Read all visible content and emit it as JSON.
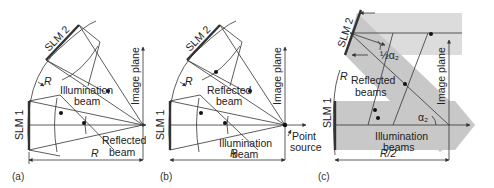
{
  "figure": {
    "panels": [
      {
        "id": "a",
        "tag": "(a)",
        "labels": {
          "slm1": "SLM 1",
          "slm2": "SLM 2",
          "image_plane": "Image plane",
          "radius_small": "R",
          "radius_bottom": "R",
          "illum_1": "Illumination",
          "illum_2": "beam",
          "refl_1": "Reflected",
          "refl_2": "beam"
        }
      },
      {
        "id": "b",
        "tag": "(b)",
        "labels": {
          "slm1": "SLM 1",
          "slm2": "SLM 2",
          "image_plane": "Image plane",
          "radius_small": "R",
          "radius_bottom": "R",
          "refl_1": "Reflected",
          "refl_2": "beam",
          "illum_1": "Illumination",
          "illum_2": "beam",
          "point_1": "Point",
          "point_2": "source"
        }
      },
      {
        "id": "c",
        "tag": "(c)",
        "labels": {
          "slm1": "SLM 1",
          "slm2": "SLM 2",
          "image_plane": "Image plane",
          "radius_small": "R",
          "radius_bottom": "R/2",
          "half_alpha": "½α₂",
          "alpha": "α₂",
          "refl_1": "Reflected",
          "refl_2": "beams",
          "illum_1": "Illumination",
          "illum_2": "beams"
        }
      }
    ],
    "colors": {
      "line": "#333333",
      "beam_fill": "#c8c8c8",
      "beam_fill_light": "#dcdcdc",
      "background": "#ffffff"
    }
  }
}
